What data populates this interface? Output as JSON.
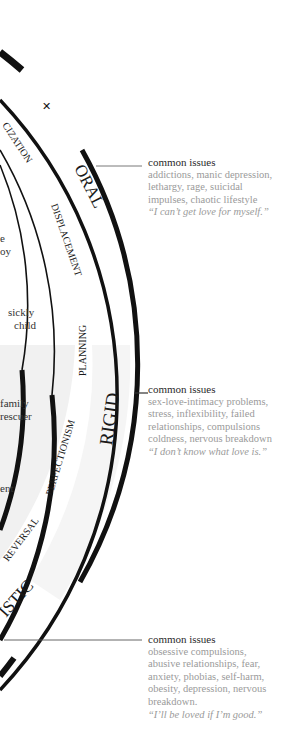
{
  "diagram": {
    "layers": [
      {
        "name": "ORAL",
        "defense": "DISPLACEMENT",
        "inner_defense_fragment": "CIZATION"
      },
      {
        "name": "RIGID",
        "defense": "PLANNING",
        "defense2": "PERFECTIONISM"
      },
      {
        "name_fragment": "ISTIC",
        "defense": "REVERSAL"
      }
    ],
    "labels": {
      "oral": "ORAL",
      "rigid": "RIGID",
      "istic": "ISTIC",
      "cization": "CIZATION",
      "displacement": "DISPLACEMENT",
      "planning": "PLANNING",
      "perfectionism": "PERFECTIONISM",
      "reversal": "REVERSAL"
    },
    "inner_fragments": {
      "e": "e",
      "oy": "oy",
      "sickly_child_1": "sickly",
      "sickly_child_2": "child",
      "family": "family",
      "rescuer": "rescuer",
      "ent": "ent"
    }
  },
  "notes": [
    {
      "heading": "common issues",
      "lines": [
        "addictions, manic depression,",
        "lethargy, rage, suicidal",
        "impulses, chaotic lifestyle"
      ],
      "quote": "“I can’t get love for myself.”"
    },
    {
      "heading": "common issues",
      "lines": [
        "sex-love-intimacy problems,",
        "stress, inflexibility, failed",
        "relationships, compulsions",
        "coldness, nervous breakdown"
      ],
      "quote": "“I don’t know what love is.”"
    },
    {
      "heading": "common issues",
      "lines": [
        "obsessive compulsions,",
        "abusive relationships, fear,",
        "anxiety, phobias, self-harm,",
        "obesity, depression, nervous",
        "breakdown."
      ],
      "quote": "“I’ll be loved if I’m good.”"
    }
  ],
  "colors": {
    "ink": "#111111",
    "note_text": "#9a9a9a",
    "note_heading": "#2a2a2a",
    "shade": "#f1f1f1"
  }
}
